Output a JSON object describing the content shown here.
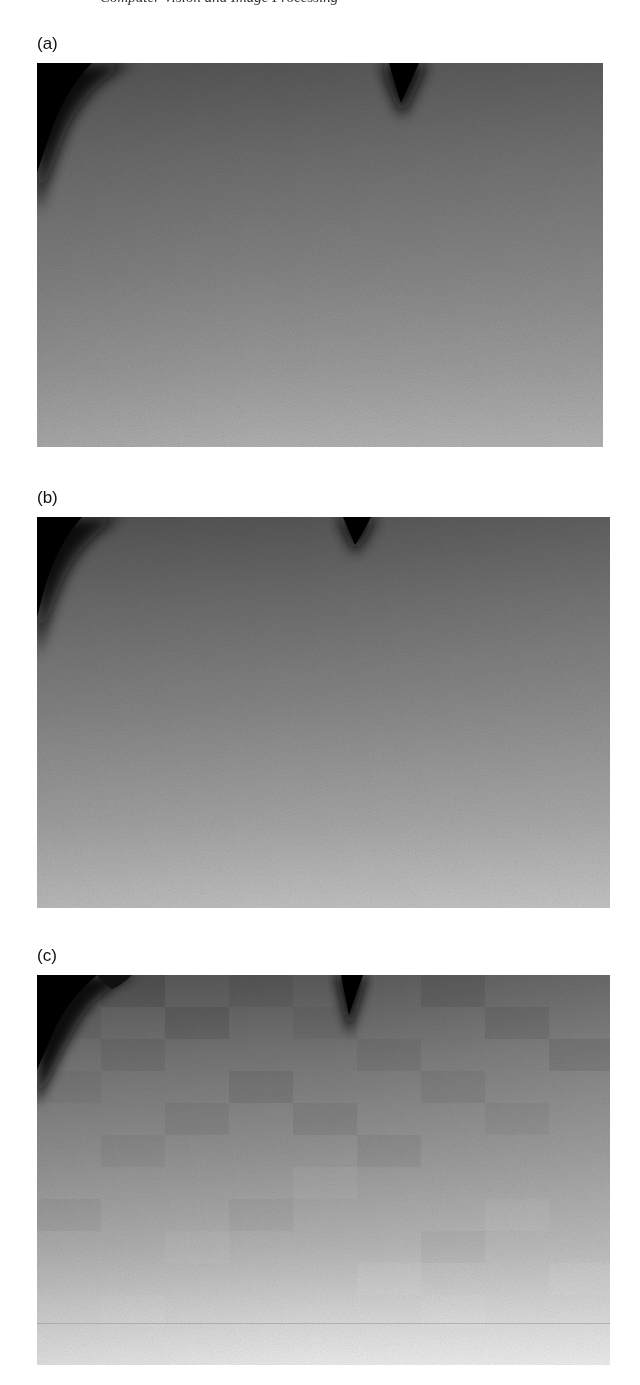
{
  "page": {
    "running_head": "Computer Vision and Image Processing",
    "background": "#ffffff"
  },
  "panels": [
    {
      "label": "(a)",
      "description": "grayscale image, noisy gradient, dark top-left corner and dark notch at top center",
      "gradient_top": "#5a5a5a",
      "gradient_bottom": "#b4b4b4"
    },
    {
      "label": "(b)",
      "description": "grayscale image, smoothed texture, dark top-left corner and dark notch at top center",
      "gradient_top": "#585858",
      "gradient_bottom": "#c2c2c2"
    },
    {
      "label": "(c)",
      "description": "grayscale image with blocky compression artifacts, dark top-left corner and notch at top center",
      "gradient_top": "#5e5e5e",
      "gradient_bottom": "#ebebeb"
    }
  ]
}
